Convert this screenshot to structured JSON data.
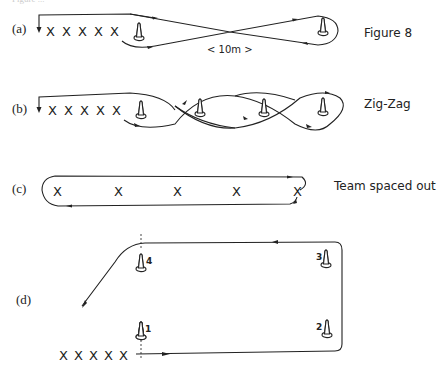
{
  "header": {
    "partial_caption": "Figure ..."
  },
  "diagrams": [
    {
      "id": "a",
      "label": "(a)",
      "title": "Figure 8",
      "players": [
        "X",
        "X",
        "X",
        "X",
        "X"
      ],
      "cones": 2,
      "distance_label": "< 10m >"
    },
    {
      "id": "b",
      "label": "(b)",
      "title": "Zig-Zag",
      "players": [
        "X",
        "X",
        "X",
        "X",
        "X"
      ],
      "cones": 4
    },
    {
      "id": "c",
      "label": "(c)",
      "title": "Team spaced out",
      "players": [
        "X",
        "X",
        "X",
        "X",
        "X"
      ]
    },
    {
      "id": "d",
      "label": "(d)",
      "players": [
        "X",
        "X",
        "X",
        "X",
        "X"
      ],
      "cone_numbers": [
        "1",
        "2",
        "3",
        "4"
      ]
    }
  ]
}
